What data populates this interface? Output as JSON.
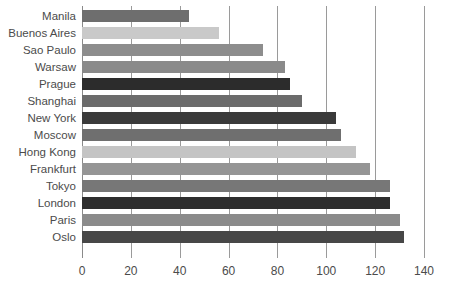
{
  "chart_data": {
    "type": "bar",
    "orientation": "horizontal",
    "title": "",
    "subtitle": "",
    "xlabel": "",
    "ylabel": "",
    "xlim": [
      0,
      140
    ],
    "ylim": null,
    "grid": "vertical",
    "legend": "none",
    "xticks": [
      0,
      20,
      40,
      60,
      80,
      100,
      120,
      140
    ],
    "xtick_labels": [
      "0",
      "20",
      "40",
      "60",
      "80",
      "100",
      "120",
      "140"
    ],
    "categories": [
      "Manila",
      "Buenos Aires",
      "Sao Paulo",
      "Warsaw",
      "Prague",
      "Shanghai",
      "New York",
      "Moscow",
      "Hong Kong",
      "Frankfurt",
      "Tokyo",
      "London",
      "Paris",
      "Oslo"
    ],
    "values": [
      44,
      56,
      74,
      83,
      85,
      90,
      104,
      106,
      112,
      118,
      126,
      126,
      130,
      132
    ],
    "bar_colors": [
      "#6e6e6e",
      "#c9c9c9",
      "#8d8d8d",
      "#8a8a8a",
      "#2c2c2c",
      "#6b6b6b",
      "#3a3a3a",
      "#6f6f6f",
      "#c4c4c4",
      "#959595",
      "#777777",
      "#2e2e2e",
      "#8b8b8b",
      "#474747"
    ]
  },
  "axis": {
    "grid_color": "#9a9a9a",
    "tick_label_color": "#4b4b4b",
    "category_label_color": "#4b4b4b",
    "background": "#ffffff"
  }
}
